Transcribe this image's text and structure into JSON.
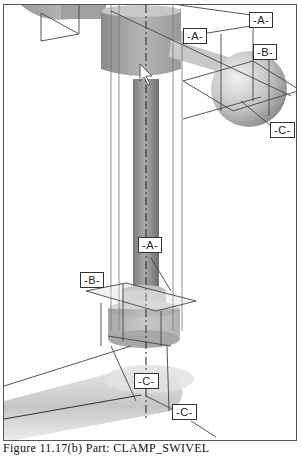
{
  "figure": {
    "part_name": "CLAMP_SWIVEL",
    "caption": "Figure 11.17(b) Part: CLAMP_SWIVEL",
    "datums": [
      {
        "id": "A-top-right",
        "label": "-A-"
      },
      {
        "id": "A-top-mid",
        "label": "-A-"
      },
      {
        "id": "B-top-right",
        "label": "-B-"
      },
      {
        "id": "C-right",
        "label": "-C-"
      },
      {
        "id": "A-mid",
        "label": "-A-"
      },
      {
        "id": "B-left",
        "label": "-B-"
      },
      {
        "id": "C-bottom",
        "label": "-C-"
      },
      {
        "id": "C-bottom-right",
        "label": "-C-"
      }
    ],
    "colors": {
      "frame": "#555555",
      "part_shade": "#9a9a9a",
      "part_light": "#d8d8d8",
      "datum_plane": "#444444"
    }
  }
}
